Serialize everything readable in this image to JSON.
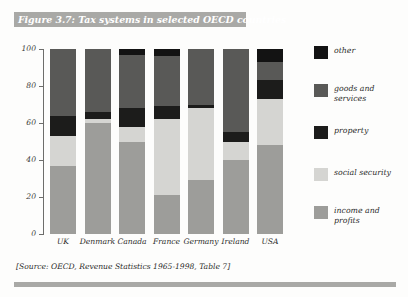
{
  "figure": {
    "title": "Figure 3.7: Tax systems in selected OECD countries",
    "source_note": "[Source: OECD, Revenue Statistics 1965-1998, Table 7]"
  },
  "legend": {
    "position": "right",
    "entries": [
      {
        "label": "other",
        "color": "#131313"
      },
      {
        "label": "goods and services",
        "color": "#595957"
      },
      {
        "label": "property",
        "color": "#1c1c1b"
      },
      {
        "label": "social security",
        "color": "#d5d5d2"
      },
      {
        "label": "income and profits",
        "color": "#9d9d9a"
      }
    ]
  },
  "axes": {
    "y_title": "percentage of total tax revenue",
    "y_ticks": [
      "0",
      "20",
      "40",
      "60",
      "80",
      "100"
    ],
    "y_min": 0,
    "y_max": 100
  },
  "chart_data": {
    "type": "bar",
    "stacked": true,
    "title": "Figure 3.7: Tax systems in selected OECD countries",
    "xlabel": "",
    "ylabel": "percentage of total tax revenue",
    "ylim": [
      0,
      100
    ],
    "yticks": [
      0,
      20,
      40,
      60,
      80,
      100
    ],
    "grid": false,
    "legend_position": "right",
    "categories": [
      "UK",
      "Denmark",
      "Canada",
      "France",
      "Germany",
      "Ireland",
      "USA"
    ],
    "series": [
      {
        "name": "income and profits",
        "color": "#9d9d9a",
        "values": [
          37,
          60,
          50,
          21,
          29,
          40,
          48
        ]
      },
      {
        "name": "social security",
        "color": "#d5d5d2",
        "values": [
          16,
          2,
          8,
          41,
          39,
          10,
          25
        ]
      },
      {
        "name": "property",
        "color": "#1c1c1b",
        "values": [
          11,
          4,
          10,
          7,
          2,
          5,
          10
        ]
      },
      {
        "name": "goods and services",
        "color": "#595957",
        "values": [
          36,
          34,
          29,
          27,
          30,
          45,
          10
        ]
      },
      {
        "name": "other",
        "color": "#131313",
        "values": [
          0,
          0,
          3,
          4,
          0,
          0,
          7
        ]
      }
    ]
  }
}
